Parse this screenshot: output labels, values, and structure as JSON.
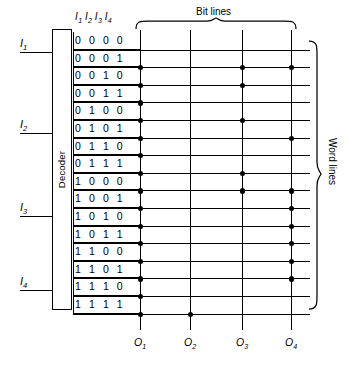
{
  "diagram": {
    "decoder_label": "Decoder",
    "bit_lines_caption": "Bit lines",
    "word_lines_caption": "Word lines",
    "code_header": "I₁ I₂ I₃ I₄",
    "inputs": [
      {
        "label": "I₁",
        "base": "I",
        "sub": "1",
        "y": 52
      },
      {
        "label": "I₂",
        "base": "I",
        "sub": "2",
        "y": 133
      },
      {
        "label": "I₃",
        "base": "I",
        "sub": "3",
        "y": 216
      },
      {
        "label": "I₄",
        "base": "I",
        "sub": "4",
        "y": 290
      }
    ],
    "outputs": [
      {
        "label": "O₁",
        "base": "O",
        "sub": "1",
        "x": 140
      },
      {
        "label": "O₂",
        "base": "O",
        "sub": "2",
        "x": 190
      },
      {
        "label": "O₃",
        "base": "O",
        "sub": "3",
        "x": 242
      },
      {
        "label": "O₄",
        "base": "O",
        "sub": "4",
        "x": 291
      }
    ],
    "word_line_codes": [
      "0 0 0 0",
      "0 0 0 1",
      "0 0 1 0",
      "0 0 1 1",
      "0 1 0 0",
      "0 1 0 1",
      "0 1 1 0",
      "0 1 1 1",
      "1 0 0 0",
      "1 0 0 1",
      "1 0 1 0",
      "1 0 1 1",
      "1 1 0 0",
      "1 1 0 1",
      "1 1 1 0",
      "1 1 1 1"
    ],
    "bit_line_columns": [
      "O1",
      "O2",
      "O3",
      "O4"
    ],
    "connection_matrix": [
      [
        0,
        0,
        0,
        0
      ],
      [
        1,
        0,
        1,
        1
      ],
      [
        1,
        0,
        1,
        0
      ],
      [
        1,
        0,
        0,
        0
      ],
      [
        1,
        0,
        1,
        0
      ],
      [
        1,
        0,
        0,
        1
      ],
      [
        1,
        0,
        0,
        0
      ],
      [
        1,
        0,
        1,
        0
      ],
      [
        1,
        0,
        1,
        1
      ],
      [
        1,
        0,
        0,
        1
      ],
      [
        1,
        0,
        0,
        1
      ],
      [
        1,
        0,
        0,
        1
      ],
      [
        1,
        0,
        0,
        1
      ],
      [
        1,
        0,
        0,
        1
      ],
      [
        1,
        0,
        0,
        0
      ],
      [
        1,
        1,
        0,
        0
      ]
    ],
    "colors": {
      "line": "#000000",
      "background": "#ffffff",
      "dot": "#000000"
    },
    "geometry": {
      "row_pitch": 17.6,
      "first_row_top": 32,
      "code_left": 73,
      "grid_right": 310,
      "bit_line_top": 30,
      "bit_line_bottom": 330
    }
  }
}
